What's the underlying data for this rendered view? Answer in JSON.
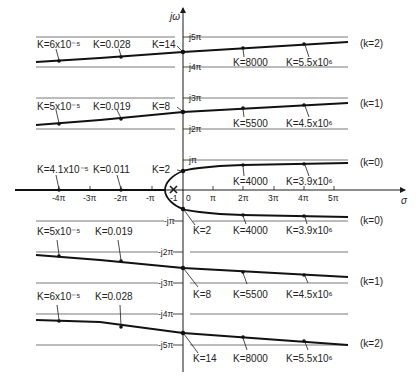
{
  "diagram": {
    "type": "root-locus",
    "axes": {
      "real_axis_label": "σ",
      "imag_axis_label": "jω",
      "real_ticks": [
        "-4π",
        "-3π",
        "-2π",
        "-π",
        "0",
        "π",
        "2π",
        "3π",
        "4π",
        "5π"
      ],
      "imag_ticks": [
        "j5π",
        "j4π",
        "j3π",
        "j2π",
        "jπ",
        "-jπ",
        "-j2π",
        "-j3π",
        "-j4π",
        "-j5π"
      ],
      "pole_label": "-1",
      "origin_label": "0"
    },
    "branches": [
      {
        "tag": "(k=2)",
        "side": "upper",
        "gain_labels": [
          "K=6x10⁻⁵",
          "K=0.028",
          "K=14",
          "K=8000",
          "K=5.5x10⁶"
        ]
      },
      {
        "tag": "(k=1)",
        "side": "upper",
        "gain_labels": [
          "K=5x10⁻⁵",
          "K=0.019",
          "K=8",
          "K=5500",
          "K=4.5x10⁶"
        ]
      },
      {
        "tag": "(k=0)",
        "side": "upper",
        "gain_labels": [
          "K=4.1x10⁻⁵",
          "K=0.011",
          "K=2",
          "K=4000",
          "K=3.9x10⁶"
        ]
      },
      {
        "tag": "(k=0)",
        "side": "lower",
        "gain_labels": [
          "K=2",
          "K=4000",
          "K=3.9x10⁶"
        ]
      },
      {
        "tag": "(k=1)",
        "side": "lower",
        "gain_labels": [
          "K=5x10⁻⁵",
          "K=0.019",
          "K=8",
          "K=5500",
          "K=4.5x10⁶"
        ]
      },
      {
        "tag": "(k=2)",
        "side": "lower",
        "gain_labels": [
          "K=6x10⁻⁵",
          "K=0.028",
          "K=14",
          "K=8000",
          "K=5.5x10⁶"
        ]
      }
    ]
  },
  "labels": {
    "jw": "jω",
    "sigma": "σ",
    "tick_j5": "j5π",
    "tick_j4": "j4π",
    "tick_j3": "j3π",
    "tick_j2": "j2π",
    "tick_j1": "jπ",
    "tick_mj1": "-jπ",
    "tick_mj2": "-j2π",
    "tick_mj3": "-j3π",
    "tick_mj4": "-j4π",
    "tick_mj5": "-j5π",
    "tick_m4": "-4π",
    "tick_m3": "-3π",
    "tick_m2": "-2π",
    "tick_m1": "-π",
    "tick_m1pole": "-1",
    "tick_0": "0",
    "tick_1": "π",
    "tick_2": "2π",
    "tick_3": "3π",
    "tick_4": "4π",
    "tick_5": "5π",
    "u2_a": "K=6x10⁻⁵",
    "u2_b": "K=0.028",
    "u2_c": "K=14",
    "u2_d": "K=8000",
    "u2_e": "K=5.5x10⁶",
    "u2_tag": "(k=2)",
    "u1_a": "K=5x10⁻⁵",
    "u1_b": "K=0.019",
    "u1_c": "K=8",
    "u1_d": "K=5500",
    "u1_e": "K=4.5x10⁶",
    "u1_tag": "(k=1)",
    "u0_a": "K=4.1x10⁻⁵",
    "u0_b": "K=0.011",
    "u0_c": "K=2",
    "u0_d": "K=4000",
    "u0_e": "K=3.9x10⁶",
    "u0_tag": "(k=0)",
    "l0_c": "K=2",
    "l0_d": "K=4000",
    "l0_e": "K=3.9x10⁶",
    "l0_tag": "(k=0)",
    "l1_a": "K=5x10⁻⁵",
    "l1_b": "K=0.019",
    "l1_c": "K=8",
    "l1_d": "K=5500",
    "l1_e": "K=4.5x10⁶",
    "l1_tag": "(k=1)",
    "l2_a": "K=6x10⁻⁵",
    "l2_b": "K=0.028",
    "l2_c": "K=14",
    "l2_d": "K=8000",
    "l2_e": "K=5.5x10⁶",
    "l2_tag": "(k=2)"
  },
  "colors": {
    "ink": "#1a1a1a",
    "guide": "#555555",
    "background": "#ffffff"
  }
}
